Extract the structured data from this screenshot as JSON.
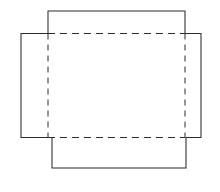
{
  "figure": {
    "background_color": "#ffffff",
    "line_color": "#2b2b2b",
    "canvas": {
      "width": 220,
      "height": 192
    }
  },
  "geometry": {
    "units": "px",
    "fold_rectangle": {
      "left": 48,
      "top": 33.5,
      "right": 185,
      "bottom": 137.5
    },
    "side_wings": {
      "left": 21,
      "top": 33.5,
      "right": 201,
      "bottom": 137.5
    },
    "top_flap": {
      "left": 48,
      "top": 11,
      "right": 185,
      "bottom": 33.5
    },
    "bottom_flap": {
      "left": 52,
      "top": 137.5,
      "right": 186,
      "bottom": 168
    }
  },
  "shapes": {
    "cut_outline_path": "M 48 33.5 L 48 11 L 185 11 L 185 33.5 L 201 33.5 L 201 137.5 L 186 137.5 L 186 168 L 52 168 L 52 137.5 L 21 137.5 L 21 33.5 Z",
    "fold_lines": [
      {
        "name": "fold-top",
        "x1": 48,
        "y1": 33.5,
        "x2": 185,
        "y2": 33.5
      },
      {
        "name": "fold-bottom",
        "x1": 48,
        "y1": 137.5,
        "x2": 185,
        "y2": 137.5
      },
      {
        "name": "fold-left",
        "x1": 48,
        "y1": 33.5,
        "x2": 48,
        "y2": 137.5
      },
      {
        "name": "fold-right",
        "x1": 185,
        "y1": 33.5,
        "x2": 185,
        "y2": 137.5
      }
    ],
    "dash_pattern": "7 5",
    "dash_pattern_vertical": "6 5"
  },
  "labels": {
    "none_visible": ""
  }
}
